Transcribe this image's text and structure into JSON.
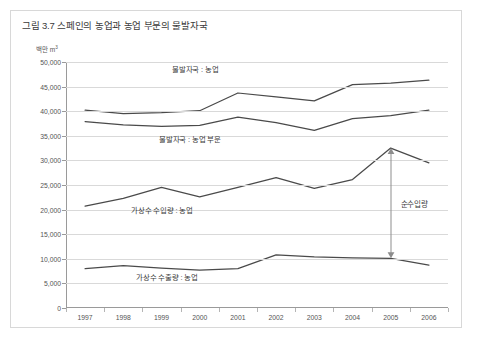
{
  "figure": {
    "title": "그림 3.7 스페인의 농업과 농업 부문의 물발자국",
    "unit_label": "백만 m",
    "unit_superscript": "3"
  },
  "chart_data": {
    "type": "line",
    "title": "그림 3.7 스페인의 농업과 농업 부문의 물발자국",
    "xlabel": "",
    "ylabel": "백만 m3",
    "ylim": [
      0,
      50000
    ],
    "ytick_values": [
      0,
      5000,
      10000,
      15000,
      20000,
      25000,
      30000,
      35000,
      40000,
      45000,
      50000
    ],
    "ytick_labels": [
      "0",
      "5,000",
      "10,000",
      "15,000",
      "20,000",
      "25,000",
      "30,000",
      "35,000",
      "40,000",
      "45,000",
      "50,000"
    ],
    "grid": true,
    "legend_position": "inline-annotations",
    "categories": [
      "1997",
      "1998",
      "1999",
      "2000",
      "2001",
      "2002",
      "2003",
      "2004",
      "2005",
      "2006"
    ],
    "series": [
      {
        "name": "물발자국 : 농업",
        "values": [
          40200,
          39500,
          39700,
          40100,
          43700,
          42900,
          42100,
          45400,
          45700,
          46300
        ]
      },
      {
        "name": "물발자국 : 농업 부문",
        "values": [
          37900,
          37200,
          36900,
          37100,
          38800,
          37700,
          36100,
          38500,
          39100,
          40200
        ]
      },
      {
        "name": "가상수 수입량 : 농업",
        "values": [
          20700,
          22300,
          24500,
          22600,
          24500,
          26500,
          24300,
          26100,
          32500,
          29500
        ]
      },
      {
        "name": "가상수 수출량 : 농업",
        "values": [
          8000,
          8600,
          8100,
          7700,
          8000,
          10800,
          10400,
          10200,
          10100,
          8700
        ]
      }
    ],
    "annotations": [
      {
        "text": "물발자국 : 농업",
        "series": "물발자국 : 농업"
      },
      {
        "text": "물발자국 : 농업 부문",
        "series": "물발자국 : 농업 부문"
      },
      {
        "text": "가상수 수입량 : 농업",
        "series": "가상수 수입량 : 농업"
      },
      {
        "text": "가상수 수출량 : 농업",
        "series": "가상수 수출량 : 농업"
      },
      {
        "text": "순수입량",
        "type": "double-arrow",
        "from_year": "2005",
        "from_value": 32500,
        "to_value": 10100
      }
    ]
  },
  "colors": {
    "line": "#4a4a4a",
    "grid": "#d9d9d9",
    "axis": "#9a9a9a",
    "text": "#3a3a3a",
    "background": "#ffffff"
  }
}
